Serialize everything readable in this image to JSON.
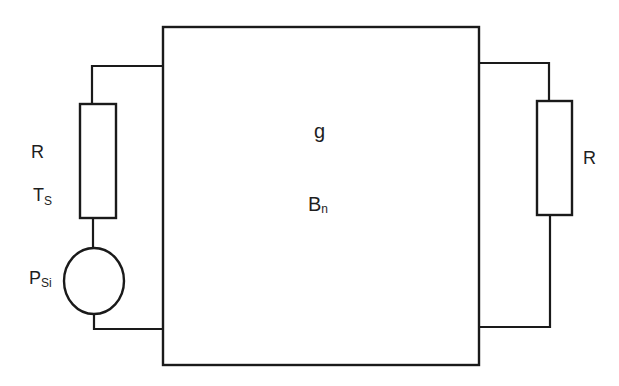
{
  "diagram": {
    "type": "circuit",
    "components": {
      "amplifier_block": {
        "gain_label": "g",
        "bandwidth_label_main": "B",
        "bandwidth_label_sub": "n"
      },
      "source_resistor": {
        "label": "R",
        "temperature_label_main": "T",
        "temperature_label_sub": "S"
      },
      "source": {
        "label_main": "P",
        "label_sub": "Si"
      },
      "load_resistor": {
        "label": "R"
      }
    },
    "colors": {
      "stroke": "#1a1a1a",
      "background": "#ffffff"
    }
  }
}
